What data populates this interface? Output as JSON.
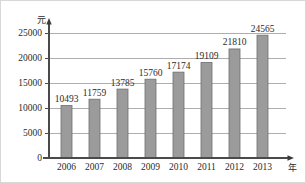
{
  "chart_data": {
    "type": "bar",
    "title": "",
    "subtitle": "",
    "xlabel": "年",
    "ylabel": "元",
    "categories": [
      "2006",
      "2007",
      "2008",
      "2009",
      "2010",
      "2011",
      "2012",
      "2013"
    ],
    "values": [
      10493,
      11759,
      13785,
      15760,
      17174,
      19109,
      21810,
      24565
    ],
    "value_labels": [
      "10493",
      "11759",
      "13785",
      "15760",
      "17174",
      "19109",
      "21810",
      "24565"
    ],
    "ylim": [
      0,
      25000
    ],
    "yticks": [
      0,
      5000,
      10000,
      15000,
      20000,
      25000
    ],
    "ytick_labels": [
      "0",
      "5000",
      "10000",
      "15000",
      "20000",
      "25000"
    ],
    "grid": true,
    "grid_axis": "y",
    "legend": null,
    "legend_position": "none",
    "bar_color": "#9b9b9b",
    "bar_border_color": "#6e6e6e",
    "axis_color": "#4a4a4a",
    "grid_color": "#8c8c8c",
    "text_color": "#2b2b2b",
    "background": "#ffffff",
    "series": [
      {
        "name": "",
        "values": [
          10493,
          11759,
          13785,
          15760,
          17174,
          19109,
          21810,
          24565
        ]
      }
    ],
    "annotations": []
  },
  "axis": {
    "y_unit_label": "元",
    "x_unit_label": "年"
  }
}
